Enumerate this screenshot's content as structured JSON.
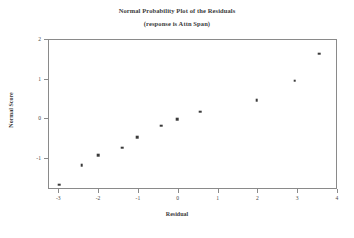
{
  "chart_data": {
    "type": "scatter",
    "title": "Normal Probability Plot of the Residuals",
    "subtitle": "(response is Attn Span)",
    "xlabel": "Residual",
    "ylabel": "Normal Score",
    "xlim": [
      -3.27,
      4.0
    ],
    "ylim": [
      -1.78,
      2.0
    ],
    "xticks": [
      -3,
      -2,
      -1,
      0,
      1,
      2,
      3,
      4
    ],
    "xtick_labels": [
      "-3",
      "-2",
      "-1",
      "0",
      "1",
      "2",
      "3",
      "4"
    ],
    "yticks": [
      -1,
      0,
      1,
      2
    ],
    "ytick_labels": [
      "-1",
      "0",
      "1",
      "2"
    ],
    "grid": false,
    "legend": null,
    "marker": "square",
    "marker_color": "#3a3a3a",
    "frame_color": "#8a8a8a",
    "points": [
      {
        "x": -2.97,
        "y": -1.67
      },
      {
        "x": -2.41,
        "y": -1.18
      },
      {
        "x": -1.99,
        "y": -0.93
      },
      {
        "x": -1.39,
        "y": -0.74
      },
      {
        "x": -1.01,
        "y": -0.48
      },
      {
        "x": -0.41,
        "y": -0.19
      },
      {
        "x": -0.01,
        "y": -0.02
      },
      {
        "x": 0.57,
        "y": 0.17
      },
      {
        "x": 1.98,
        "y": 0.46
      },
      {
        "x": 2.94,
        "y": 0.95
      },
      {
        "x": 3.55,
        "y": 1.63
      }
    ]
  }
}
